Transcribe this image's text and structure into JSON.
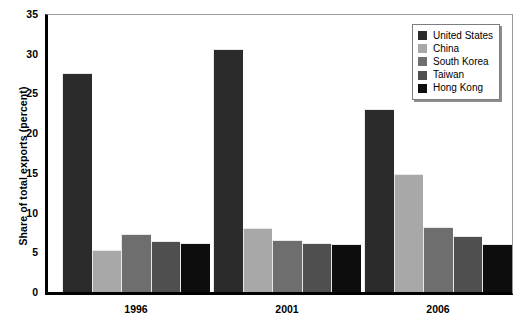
{
  "chart_data": {
    "type": "bar",
    "title": "",
    "subtitle": "",
    "xlabel": "",
    "ylabel": "Share of total exports (percent)",
    "categories": [
      "1996",
      "2001",
      "2006"
    ],
    "ylim": [
      0,
      35
    ],
    "ytick_step": 5,
    "yticks": [
      0,
      5,
      10,
      15,
      20,
      25,
      30,
      35
    ],
    "ytick_labels": [
      "0",
      "5",
      "10",
      "15",
      "20",
      "25",
      "30",
      "35"
    ],
    "grid": false,
    "legend_position": "top-right",
    "series": [
      {
        "name": "United States",
        "color": "#2b2b2b",
        "values": [
          27.6,
          30.6,
          23.1
        ]
      },
      {
        "name": "China",
        "color": "#a8a8a8",
        "values": [
          5.3,
          8.0,
          14.8
        ]
      },
      {
        "name": "South Korea",
        "color": "#6e6e6e",
        "values": [
          7.3,
          6.6,
          8.2
        ]
      },
      {
        "name": "Taiwan",
        "color": "#4f4f4f",
        "values": [
          6.4,
          6.2,
          7.1
        ]
      },
      {
        "name": "Hong Kong",
        "color": "#0d0d0d",
        "values": [
          6.2,
          6.0,
          6.0
        ]
      }
    ]
  },
  "axes": {
    "y_title": "Share of total exports (percent)"
  },
  "legend": {
    "entries": [
      {
        "label": "United States",
        "color": "#2b2b2b"
      },
      {
        "label": "China",
        "color": "#a8a8a8"
      },
      {
        "label": "South Korea",
        "color": "#6e6e6e"
      },
      {
        "label": "Taiwan",
        "color": "#4f4f4f"
      },
      {
        "label": "Hong Kong",
        "color": "#0d0d0d"
      }
    ]
  }
}
